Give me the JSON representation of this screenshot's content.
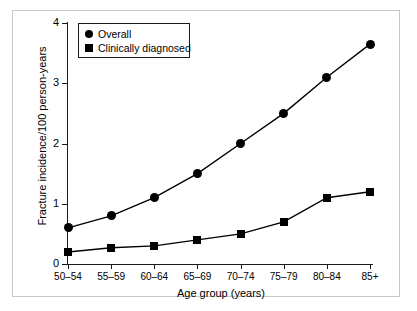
{
  "chart_data": {
    "type": "line",
    "title": "",
    "xlabel": "Age group (years)",
    "ylabel": "Fracture incidence/100 person-years",
    "categories": [
      "50–54",
      "55–59",
      "60–64",
      "65–69",
      "70–74",
      "75–79",
      "80–84",
      "85+"
    ],
    "ylim": [
      0,
      4
    ],
    "yticks": [
      "0",
      "1",
      "2",
      "3",
      "4"
    ],
    "ytick_values": [
      0,
      1,
      2,
      3,
      4
    ],
    "grid": false,
    "legend_position": "top-left",
    "series": [
      {
        "name": "Overall",
        "marker": "circle",
        "color": "#000000",
        "values": [
          0.6,
          0.8,
          1.1,
          1.5,
          2.0,
          2.5,
          3.1,
          3.65
        ]
      },
      {
        "name": "Clinically diagnosed",
        "marker": "square",
        "color": "#000000",
        "values": [
          0.2,
          0.27,
          0.3,
          0.4,
          0.5,
          0.7,
          1.1,
          1.2
        ]
      }
    ]
  },
  "legend": {
    "entries": [
      {
        "label": "Overall",
        "marker": "circle"
      },
      {
        "label": "Clinically diagnosed",
        "marker": "square"
      }
    ]
  }
}
